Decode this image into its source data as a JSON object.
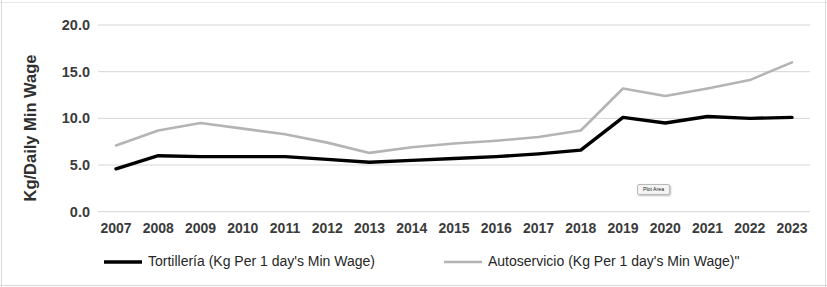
{
  "tooltip": {
    "label": "Plot Area"
  },
  "legend": {
    "items": [
      {
        "label": "Tortillería (Kg Per 1 day's Min Wage)",
        "color": "#000000"
      },
      {
        "label": "Autoservicio (Kg Per 1 day's Min Wage)\"",
        "color": "#b4b4b4"
      }
    ]
  },
  "chart_data": {
    "type": "line",
    "title": "",
    "xlabel": "",
    "ylabel": "Kg/Daily Min Wage",
    "categories": [
      "2007",
      "2008",
      "2009",
      "2010",
      "2011",
      "2012",
      "2013",
      "2014",
      "2015",
      "2016",
      "2017",
      "2018",
      "2019",
      "2020",
      "2021",
      "2022",
      "2023"
    ],
    "ylim": [
      0.0,
      20.0
    ],
    "yticks": [
      0.0,
      5.0,
      10.0,
      15.0,
      20.0
    ],
    "ytick_labels": [
      "0.0",
      "5.0",
      "10.0",
      "15.0",
      "20.0"
    ],
    "grid": true,
    "legend_position": "bottom",
    "series": [
      {
        "name": "Tortillería (Kg Per 1 day's Min Wage)",
        "color": "#000000",
        "values": [
          4.6,
          6.0,
          5.9,
          5.9,
          5.9,
          5.6,
          5.3,
          5.5,
          5.7,
          5.9,
          6.2,
          6.6,
          10.1,
          9.5,
          10.2,
          10.0,
          10.1
        ]
      },
      {
        "name": "Autoservicio (Kg Per 1 day's Min Wage)\"",
        "color": "#b4b4b4",
        "values": [
          7.1,
          8.7,
          9.5,
          8.9,
          8.3,
          7.4,
          6.3,
          6.9,
          7.3,
          7.6,
          8.0,
          8.7,
          13.2,
          12.4,
          13.2,
          14.1,
          16.0
        ]
      }
    ]
  }
}
